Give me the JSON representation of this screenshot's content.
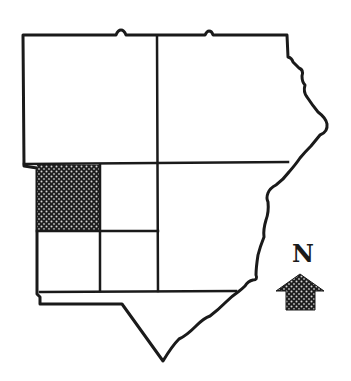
{
  "map": {
    "regions": [
      {
        "id": "north-west",
        "shaded": false
      },
      {
        "id": "north-east",
        "shaded": false
      },
      {
        "id": "south-west-nw",
        "shaded": true
      },
      {
        "id": "south-west-ne",
        "shaded": false
      },
      {
        "id": "south-west-sw",
        "shaded": false
      },
      {
        "id": "south-west-se",
        "shaded": false
      },
      {
        "id": "south-east",
        "shaded": false
      },
      {
        "id": "southern-strip",
        "shaded": false
      }
    ],
    "colors": {
      "line": "#1a1a1a",
      "background": "#ffffff",
      "highlight": "#1e1e1e",
      "dot": "#d8d8d8"
    }
  },
  "compass": {
    "label": "N",
    "icon": "north-arrow-icon"
  }
}
